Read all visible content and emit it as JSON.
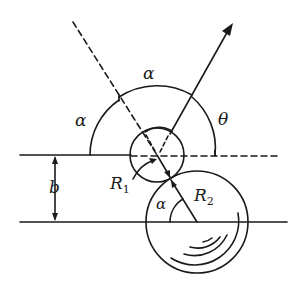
{
  "diagram": {
    "type": "geometry-scattering-diagram",
    "labels": {
      "alpha_top": "α",
      "alpha_left": "α",
      "theta": "θ",
      "b": "b",
      "R1_main": "R",
      "R1_sub": "1",
      "R2_main": "R",
      "R2_sub": "2",
      "alpha_bottom": "α"
    },
    "colors": {
      "stroke": "#1a1a1a",
      "background": "#ffffff"
    },
    "elements": {
      "upper_line": "horizontal reference line (solid left, dashed right)",
      "lower_line": "horizontal line through center of large circle",
      "small_circle": "circle of radius R1",
      "large_circle": "circle of radius R2",
      "incident_ray": "dashed incoming trajectory",
      "scattered_ray": "outgoing arrow",
      "impact_parameter": "b"
    }
  }
}
